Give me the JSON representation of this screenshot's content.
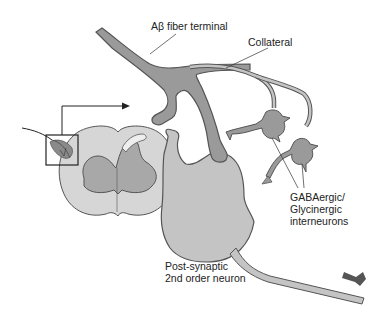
{
  "diagram": {
    "title": "",
    "labels": {
      "ab_fiber": "Aβ fiber terminal",
      "collateral": "Collateral",
      "interneurons_line1": "GABAergic/",
      "interneurons_line2": "Glycinergic",
      "interneurons_line3": "interneurons",
      "postsynaptic_line1": "Post-synaptic",
      "postsynaptic_line2": "2nd order neuron"
    },
    "components": [
      "spinal-cord-cross-section",
      "inset-box",
      "ab-fiber-terminal",
      "collateral-branch",
      "interneuron-1",
      "interneuron-2",
      "post-synaptic-neuron",
      "output-axon",
      "output-arrow"
    ],
    "colors": {
      "fill_dark": "#9a9a9a",
      "fill_light": "#c4c4c4",
      "outline": "#555555",
      "cord_outer": "#d6d6d6",
      "cord_inner": "#a8a8a8"
    }
  }
}
